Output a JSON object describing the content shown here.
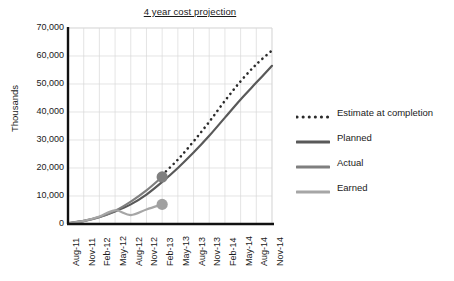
{
  "chart_data": {
    "type": "line",
    "title": "4 year cost projection",
    "xlabel": "",
    "ylabel": "Thousands",
    "ylim": [
      0,
      70000
    ],
    "ytick_labels": [
      "70,000",
      "60,000",
      "50,000",
      "40,000",
      "30,000",
      "20,000",
      "10,000",
      "0"
    ],
    "ytick_values": [
      70000,
      60000,
      50000,
      40000,
      30000,
      20000,
      10000,
      0
    ],
    "grid": true,
    "legend_position": "right",
    "categories": [
      "Aug-11",
      "Nov-11",
      "Feb-12",
      "May-12",
      "Aug-12",
      "Nov-12",
      "Feb-13",
      "May-13",
      "Aug-13",
      "Nov-13",
      "Feb-14",
      "May-14",
      "Aug-14",
      "Nov-14"
    ],
    "series": [
      {
        "name": "Estimate at completion",
        "style": "dotted",
        "color": "#2b2b2b",
        "values": [
          null,
          null,
          null,
          null,
          null,
          null,
          17500,
          23000,
          29500,
          36500,
          44000,
          51000,
          57000,
          62000
        ]
      },
      {
        "name": "Planned",
        "style": "solid",
        "color": "#595959",
        "values": [
          300,
          1100,
          2500,
          4500,
          7000,
          10500,
          15000,
          20000,
          25500,
          31500,
          38000,
          44500,
          50500,
          56500
        ]
      },
      {
        "name": "Actual",
        "style": "solid",
        "color": "#7f7f7f",
        "values": [
          250,
          1000,
          2400,
          4700,
          8000,
          12000,
          16800,
          null,
          null,
          null,
          null,
          null,
          null,
          null
        ],
        "end_marker": {
          "category": "Feb-13",
          "value": 16800
        }
      },
      {
        "name": "Earned",
        "style": "solid",
        "color": "#a6a6a6",
        "values": [
          250,
          1100,
          2700,
          4900,
          3200,
          5200,
          7000,
          null,
          null,
          null,
          null,
          null,
          null,
          null
        ],
        "end_marker": {
          "category": "Feb-13",
          "value": 7000
        }
      }
    ],
    "markers": [
      {
        "series": "Actual",
        "category": "Feb-13",
        "value": 16800,
        "color": "#808080"
      },
      {
        "series": "Earned",
        "category": "Feb-13",
        "value": 7000,
        "color": "#a0a0a0"
      }
    ]
  },
  "legend": {
    "items": [
      {
        "label": "Estimate at completion",
        "style": "dotted",
        "color": "#2b2b2b"
      },
      {
        "label": "Planned",
        "style": "solid",
        "color": "#595959"
      },
      {
        "label": "Actual",
        "style": "solid",
        "color": "#7f7f7f"
      },
      {
        "label": "Earned",
        "style": "solid",
        "color": "#a6a6a6"
      }
    ]
  },
  "axes": {
    "axis_line_color": "#111111",
    "grid_color": "#d9d9d9"
  }
}
